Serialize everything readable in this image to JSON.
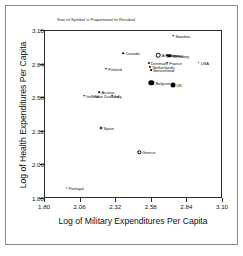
{
  "chart_data": {
    "type": "scatter",
    "title": "Size of Symbol is Proportional to Residual",
    "xlabel": "Log of Military Expenditures Per Capita",
    "ylabel": "Log of Health Expenditures Per Capita",
    "xlim": [
      1.8,
      3.1
    ],
    "ylim": [
      1.8,
      3.1
    ],
    "xticks": [
      "1.80",
      "2.06",
      "2.32",
      "2.58",
      "2.84",
      "3.10"
    ],
    "yticks": [
      "3.10",
      "2.84",
      "2.58",
      "2.32",
      "2.06",
      "1.80"
    ],
    "grid": false,
    "legend": "none",
    "points": [
      {
        "label": "Sweden",
        "x": 2.745,
        "y": 3.055,
        "size": 1.6,
        "fill": "filled"
      },
      {
        "label": "Canada",
        "x": 2.38,
        "y": 2.92,
        "size": 1.6,
        "fill": "filled"
      },
      {
        "label": "Argentina",
        "x": 2.635,
        "y": 2.905,
        "size": 4.6,
        "fill": "open"
      },
      {
        "label": "Norway",
        "x": 2.7,
        "y": 2.905,
        "size": 2.0,
        "fill": "filled"
      },
      {
        "label": "Germany",
        "x": 2.715,
        "y": 2.9,
        "size": 3.4,
        "fill": "filled"
      },
      {
        "label": "Denmark",
        "x": 2.565,
        "y": 2.845,
        "size": 2.2,
        "fill": "filled"
      },
      {
        "label": "France",
        "x": 2.7,
        "y": 2.845,
        "size": 1.5,
        "fill": "filled"
      },
      {
        "label": "USA",
        "x": 2.93,
        "y": 2.845,
        "size": 1.5,
        "fill": "filled"
      },
      {
        "label": "Netherlands",
        "x": 2.575,
        "y": 2.815,
        "size": 2.2,
        "fill": "filled"
      },
      {
        "label": "Switzerland",
        "x": 2.58,
        "y": 2.79,
        "size": 1.8,
        "fill": "filled"
      },
      {
        "label": "Finland",
        "x": 2.255,
        "y": 2.8,
        "size": 1.6,
        "fill": "filled"
      },
      {
        "label": "Belgium",
        "x": 2.585,
        "y": 2.69,
        "size": 5.4,
        "fill": "filled"
      },
      {
        "label": "UK",
        "x": 2.74,
        "y": 2.675,
        "size": 5.0,
        "fill": "filled"
      },
      {
        "label": "Austria",
        "x": 2.205,
        "y": 2.62,
        "size": 1.5,
        "fill": "filled"
      },
      {
        "label": "Ireland",
        "x": 2.095,
        "y": 2.59,
        "size": 1.5,
        "fill": "filled"
      },
      {
        "label": "New Zealand",
        "x": 2.155,
        "y": 2.59,
        "size": 1.5,
        "fill": "filled"
      },
      {
        "label": "Italy",
        "x": 2.3,
        "y": 2.59,
        "size": 1.5,
        "fill": "filled"
      },
      {
        "label": "Spain",
        "x": 2.215,
        "y": 2.34,
        "size": 3.0,
        "fill": "open"
      },
      {
        "label": "Greece",
        "x": 2.495,
        "y": 2.155,
        "size": 3.4,
        "fill": "open"
      },
      {
        "label": "Portugal",
        "x": 1.965,
        "y": 1.88,
        "size": 1.5,
        "fill": "filled"
      }
    ]
  }
}
